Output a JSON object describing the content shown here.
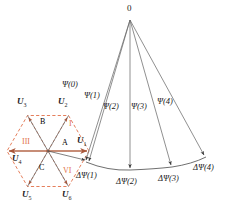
{
  "figure": {
    "type": "vector-diagram",
    "width": 235,
    "height": 210,
    "background": "#ffffff"
  },
  "colors": {
    "hexagon_dashed": "#e2714a",
    "sector_label": "#e2714a",
    "axis_arrow": "#b5674a",
    "fan_line": "#6b6b6b",
    "text": "#1a1a1a",
    "arc": "#4a4a4a"
  },
  "apex": {
    "label": "0",
    "x": 130,
    "y": 11
  },
  "hexagon": {
    "center": {
      "x": 48,
      "y": 151
    },
    "radius": 41,
    "stroke_style": "dashed",
    "vertices": [
      {
        "name": "U1",
        "label": "U",
        "sub": "1",
        "x": 89,
        "y": 151,
        "label_x": 77,
        "label_y": 140
      },
      {
        "name": "U2",
        "label": "U",
        "sub": "2",
        "x": 68.5,
        "y": 115.5,
        "label_x": 58,
        "label_y": 101
      },
      {
        "name": "U3",
        "label": "U",
        "sub": "3",
        "x": 27.5,
        "y": 115.5,
        "label_x": 17,
        "label_y": 101
      },
      {
        "name": "U4",
        "label": "U",
        "sub": "4",
        "x": 7,
        "y": 151,
        "label_x": 11,
        "label_y": 156
      },
      {
        "name": "U5",
        "label": "U",
        "sub": "5",
        "x": 27.5,
        "y": 186.5,
        "label_x": 22,
        "label_y": 192
      },
      {
        "name": "U6",
        "label": "U",
        "sub": "6",
        "x": 68.5,
        "y": 186.5,
        "label_x": 62,
        "label_y": 192
      }
    ]
  },
  "zone_labels": [
    {
      "name": "zone-a",
      "text": "A",
      "x": 63,
      "y": 142
    },
    {
      "name": "zone-b",
      "text": "B",
      "x": 41,
      "y": 122
    },
    {
      "name": "zone-c",
      "text": "C",
      "x": 40,
      "y": 168
    }
  ],
  "sector_labels": [
    {
      "name": "sector-i",
      "text": "I",
      "x": 70,
      "y": 124
    },
    {
      "name": "sector-iii",
      "text": "III",
      "x": 23,
      "y": 142
    },
    {
      "name": "sector-vi",
      "text": "VI",
      "x": 65,
      "y": 171
    }
  ],
  "flux_lines": [
    {
      "name": "psi-0",
      "label": "Ψ(0)",
      "label_x": 66,
      "label_y": 84,
      "end_x": 86,
      "end_y": 162
    },
    {
      "name": "psi-1",
      "label": "Ψ(1)",
      "label_x": 88,
      "label_y": 95,
      "end_x": 89,
      "end_y": 163
    },
    {
      "name": "psi-2",
      "label": "Ψ(2)",
      "label_x": 107,
      "label_y": 106,
      "end_x": 130,
      "end_y": 170
    },
    {
      "name": "psi-3",
      "label": "Ψ(3)",
      "label_x": 133,
      "label_y": 106,
      "end_x": 172,
      "end_y": 167
    },
    {
      "name": "psi-4",
      "label": "Ψ(4)",
      "label_x": 157,
      "label_y": 101,
      "end_x": 205,
      "end_y": 157
    }
  ],
  "delta_flux_labels": [
    {
      "name": "delta-psi-1",
      "text": "ΔΨ(1)",
      "x": 79,
      "y": 174
    },
    {
      "name": "delta-psi-2",
      "text": "ΔΨ(2)",
      "x": 119,
      "y": 180
    },
    {
      "name": "delta-psi-3",
      "text": "ΔΨ(3)",
      "x": 161,
      "y": 177
    },
    {
      "name": "delta-psi-4",
      "text": "ΔΨ(4)",
      "x": 196,
      "y": 166
    }
  ],
  "arc": {
    "name": "flux-trajectory-arc",
    "points": [
      {
        "x": 86,
        "y": 162
      },
      {
        "x": 130,
        "y": 170
      },
      {
        "x": 172,
        "y": 167
      },
      {
        "x": 206,
        "y": 157
      }
    ]
  }
}
